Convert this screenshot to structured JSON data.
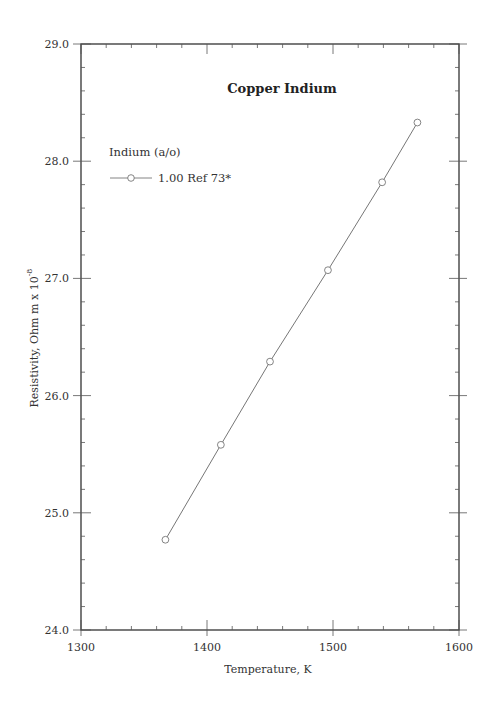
{
  "chart_data": {
    "type": "line",
    "title": "Copper Indium",
    "xlabel": "Temperature,  K",
    "ylabel": "Resistivity, Ohm m x 10",
    "ylabel_superscript": "-8",
    "xlim": [
      1300,
      1600
    ],
    "ylim": [
      24.0,
      29.0
    ],
    "x_ticks": [
      "1300",
      "1400",
      "1500",
      "1600"
    ],
    "y_ticks": [
      "24.0",
      "25.0",
      "26.0",
      "27.0",
      "28.0",
      "29.0"
    ],
    "grid": false,
    "legend_title": "Indium (a/o)",
    "legend_position": "upper left",
    "series": [
      {
        "name": "1.00 Ref 73*",
        "marker": "open-circle",
        "x": [
          1367,
          1411,
          1450,
          1496,
          1539,
          1567
        ],
        "y": [
          24.77,
          25.58,
          26.29,
          27.07,
          27.82,
          28.33
        ]
      }
    ]
  }
}
